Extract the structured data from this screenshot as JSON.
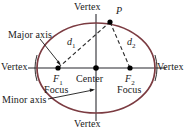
{
  "figure": {
    "type": "ellipse-anatomy-diagram",
    "colors": {
      "ellipse_stroke": "#7B3B41",
      "axis_line": "#6E6E72",
      "leader_line": "#1a1a1a",
      "dashed_line": "#2a2a2a",
      "point_fill": "#000000",
      "background": "#ffffff"
    },
    "geometry": {
      "center": {
        "x": 96,
        "y": 68
      },
      "semi_major_axis": 59,
      "semi_minor_axis": 45,
      "focus_left": {
        "x": 58,
        "y": 68
      },
      "focus_right": {
        "x": 130,
        "y": 68
      },
      "point_p": {
        "x": 110,
        "y": 22
      },
      "vertex_left": {
        "x": 37,
        "y": 68
      },
      "vertex_right": {
        "x": 155,
        "y": 68
      },
      "vertex_top": {
        "x": 96,
        "y": 23
      },
      "vertex_bottom": {
        "x": 96,
        "y": 113
      }
    },
    "labels": {
      "vertex_top": "Vertex",
      "vertex_bottom": "Vertex",
      "vertex_left": "Vertex",
      "vertex_right": "Vertex",
      "point_p": "P",
      "distance_1": "d",
      "distance_1_sub": "1",
      "distance_2": "d",
      "distance_2_sub": "2",
      "focus_1": "F",
      "focus_1_sub": "1",
      "focus_2": "F",
      "focus_2_sub": "2",
      "focus_1_word": "Focus",
      "focus_2_word": "Focus",
      "center": "Center",
      "major_axis": "Major axis",
      "minor_axis": "Minor axis"
    }
  }
}
